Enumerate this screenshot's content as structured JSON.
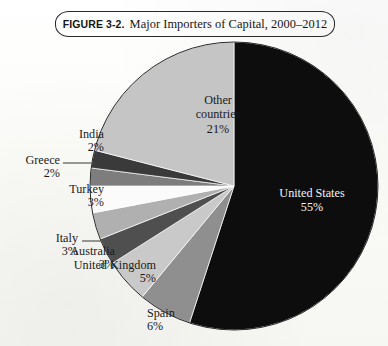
{
  "figure": {
    "number": "FIGURE 3-2.",
    "title": "Major Importers of Capital, 2000–2012"
  },
  "chart_data": {
    "type": "pie",
    "title": "Major Importers of Capital, 2000–2012",
    "unit": "percent",
    "total": 100,
    "legend": "none (labels placed on/around slices)",
    "start_angle_deg": 0,
    "direction": "clockwise",
    "categories": [
      "United States",
      "Spain",
      "United Kingdom",
      "Australia",
      "Italy",
      "Turkey",
      "Greece",
      "India",
      "Other countries"
    ],
    "values": [
      55,
      6,
      5,
      3,
      3,
      3,
      2,
      2,
      21
    ],
    "colors": [
      "#0d0d0d",
      "#8f8f8f",
      "#c9c9c9",
      "#4f4f4f",
      "#b0b0b0",
      "#fbfbfb",
      "#7d7d7d",
      "#3a3a3a",
      "#c5c5c5"
    ],
    "slices": [
      {
        "name": "United States",
        "label": "United States",
        "percent": 55,
        "value_text": "55%",
        "color": "#0d0d0d",
        "label_placement": "inside",
        "label_color": "#f4f4f4"
      },
      {
        "name": "Spain",
        "label": "Spain",
        "percent": 6,
        "value_text": "6%",
        "color": "#8f8f8f",
        "label_placement": "outside",
        "label_color": "#1b1b1b"
      },
      {
        "name": "United Kingdom",
        "label": "United Kingdom",
        "percent": 5,
        "value_text": "5%",
        "color": "#c9c9c9",
        "label_placement": "outside",
        "label_color": "#1b1b1b"
      },
      {
        "name": "Australia",
        "label": "Australia",
        "percent": 3,
        "value_text": "3%",
        "color": "#4f4f4f",
        "label_placement": "outside",
        "label_color": "#1b1b1b"
      },
      {
        "name": "Italy",
        "label": "Italy",
        "percent": 3,
        "value_text": "3%",
        "color": "#b0b0b0",
        "label_placement": "outside",
        "label_color": "#1b1b1b"
      },
      {
        "name": "Turkey",
        "label": "Turkey",
        "percent": 3,
        "value_text": "3%",
        "color": "#fbfbfb",
        "label_placement": "outside",
        "label_color": "#1b1b1b"
      },
      {
        "name": "Greece",
        "label": "Greece",
        "percent": 2,
        "value_text": "2%",
        "color": "#7d7d7d",
        "label_placement": "outside",
        "label_color": "#1b1b1b"
      },
      {
        "name": "India",
        "label": "India",
        "percent": 2,
        "value_text": "2%",
        "color": "#3a3a3a",
        "label_placement": "outside",
        "label_color": "#1b1b1b"
      },
      {
        "name": "Other countries",
        "label": "Other\ncountries",
        "percent": 21,
        "value_text": "21%",
        "color": "#c5c5c5",
        "label_placement": "inside",
        "label_color": "#1b1b1b"
      }
    ]
  },
  "labels": {
    "united_states": {
      "name": "United States",
      "pct": "55%"
    },
    "spain": {
      "name": "Spain",
      "pct": "6%"
    },
    "united_kingdom": {
      "name": "United Kingdom",
      "pct": "5%"
    },
    "australia": {
      "name": "Australia",
      "pct": "3%"
    },
    "italy": {
      "name": "Italy",
      "pct": "3%"
    },
    "turkey": {
      "name": "Turkey",
      "pct": "3%"
    },
    "greece": {
      "name": "Greece",
      "pct": "2%"
    },
    "india": {
      "name": "India",
      "pct": "2%"
    },
    "other_line1": "Other",
    "other_line2": "countries",
    "other_pct": "21%"
  }
}
